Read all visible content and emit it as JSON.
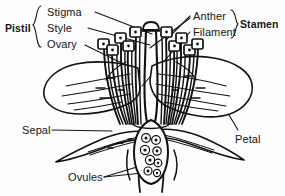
{
  "figure": {
    "background_color": "#fdfdfd",
    "ink_color": "#111111",
    "labels": {
      "pistil": "Pistil",
      "stigma": "Stigma",
      "style": "Style",
      "ovary": "Ovary",
      "anther": "Anther",
      "filament": "Filament",
      "stamen": "Stamen",
      "sepal": "Sepal",
      "petal": "Petal",
      "ovules": "Ovules"
    },
    "groups": [
      {
        "name": "Pistil",
        "members": [
          "Stigma",
          "Style",
          "Ovary"
        ],
        "brace": "left"
      },
      {
        "name": "Stamen",
        "members": [
          "Anther",
          "Filament"
        ],
        "brace": "right"
      }
    ],
    "standalone_labels": [
      "Sepal",
      "Petal",
      "Ovules"
    ]
  }
}
